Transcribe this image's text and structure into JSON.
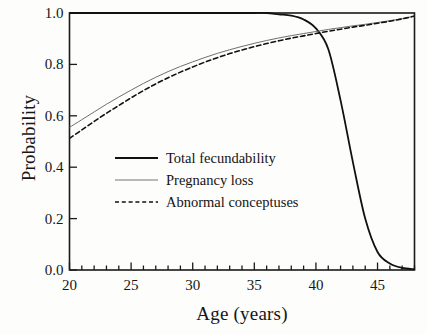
{
  "figure": {
    "background_color": "#fdfdfc",
    "axis_color": "#1a1a1a"
  },
  "chart_data": {
    "type": "line",
    "title": "",
    "xlabel": "Age (years)",
    "ylabel": "Probability",
    "xlim": [
      20,
      48
    ],
    "ylim": [
      0.0,
      1.0
    ],
    "grid": false,
    "legend_position": "center-left",
    "x_ticks_major": [
      20,
      25,
      30,
      35,
      40,
      45
    ],
    "x_tick_labels": [
      "20",
      "25",
      "30",
      "35",
      "40",
      "45"
    ],
    "x_ticks_minor_step": 1,
    "y_ticks_major": [
      0.0,
      0.2,
      0.4,
      0.6,
      0.8,
      1.0
    ],
    "y_tick_labels": [
      "0.0",
      "0.2",
      "0.4",
      "0.6",
      "0.8",
      "1.0"
    ],
    "y_ticks_minor_step": 0.05,
    "x": [
      20,
      21,
      22,
      23,
      24,
      25,
      26,
      27,
      28,
      29,
      30,
      31,
      32,
      33,
      34,
      35,
      36,
      37,
      38,
      39,
      40,
      41,
      42,
      43,
      44,
      45,
      46,
      47,
      48
    ],
    "series": [
      {
        "name": "Total fecundability",
        "style": "solid",
        "color": "#111111",
        "width": 1.8,
        "values": [
          1.0,
          1.0,
          1.0,
          1.0,
          1.0,
          1.0,
          1.0,
          1.0,
          1.0,
          1.0,
          1.0,
          1.0,
          1.0,
          1.0,
          1.0,
          1.0,
          1.0,
          0.995,
          0.99,
          0.975,
          0.94,
          0.86,
          0.66,
          0.42,
          0.2,
          0.07,
          0.025,
          0.008,
          0.003
        ]
      },
      {
        "name": "Pregnancy loss",
        "style": "solid",
        "color": "#6e6e6e",
        "width": 1.0,
        "values": [
          0.555,
          0.585,
          0.615,
          0.645,
          0.673,
          0.7,
          0.726,
          0.75,
          0.772,
          0.792,
          0.81,
          0.827,
          0.843,
          0.857,
          0.87,
          0.882,
          0.893,
          0.903,
          0.912,
          0.92,
          0.928,
          0.936,
          0.943,
          0.95,
          0.956,
          0.963,
          0.97,
          0.978,
          0.988
        ]
      },
      {
        "name": "Abnormal conceptuses",
        "style": "dashed",
        "color": "#111111",
        "width": 1.6,
        "values": [
          0.512,
          0.545,
          0.578,
          0.61,
          0.64,
          0.67,
          0.698,
          0.724,
          0.748,
          0.77,
          0.79,
          0.809,
          0.826,
          0.842,
          0.856,
          0.869,
          0.881,
          0.892,
          0.902,
          0.911,
          0.92,
          0.929,
          0.937,
          0.945,
          0.952,
          0.96,
          0.968,
          0.977,
          0.988
        ]
      }
    ],
    "legend_entries": [
      {
        "label": "Total fecundability",
        "style": "solid",
        "color": "#111111",
        "width": 1.9
      },
      {
        "label": "Pregnancy loss",
        "style": "solid",
        "color": "#777777",
        "width": 1.2
      },
      {
        "label": "Abnormal conceptuses",
        "style": "dashed",
        "color": "#111111",
        "width": 1.6
      }
    ]
  }
}
